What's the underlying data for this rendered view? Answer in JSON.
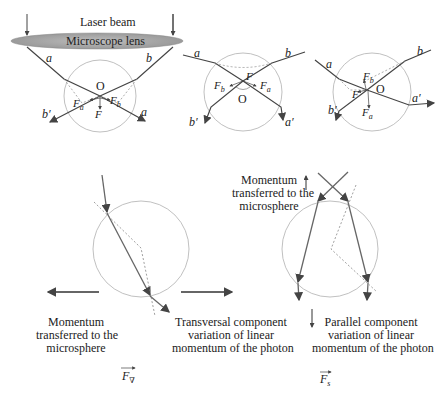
{
  "figure": {
    "top_left": {
      "laser_label": "Laser beam",
      "lens_label": "Microscope lens",
      "ray_a": "a",
      "ray_b": "b",
      "ray_a_out": "a",
      "ray_b_out": "b′",
      "center": "O",
      "force_a": "F",
      "force_a_sub": "a",
      "force_b": "F",
      "force_b_sub": "b",
      "force_total": "F"
    },
    "top_middle": {
      "ray_a": "a",
      "ray_b": "b",
      "ray_a_out": "a′",
      "ray_b_out": "b′",
      "center": "O",
      "force_a": "F",
      "force_a_sub": "a",
      "force_b": "F",
      "force_b_sub": "b",
      "force_total": "F"
    },
    "top_right": {
      "ray_a": "a",
      "ray_b": "b",
      "ray_a_out": "a′",
      "ray_b_out": "b′",
      "center": "O",
      "force_a": "F",
      "force_a_sub": "a",
      "force_b": "F",
      "force_b_sub": "b",
      "force_total": "F"
    },
    "bottom_left": {
      "momentum_label_1": "Momentum",
      "momentum_label_2": "transferred to the",
      "momentum_label_3": "microsphere",
      "transversal_label_1": "Transversal component",
      "transversal_label_2": "variation of linear",
      "transversal_label_3": "momentum of the photon",
      "force_symbol": "F",
      "force_sub": "∇"
    },
    "bottom_right": {
      "momentum_label_1": "Momentum",
      "momentum_label_2": "transferred to the",
      "momentum_label_3": "microsphere",
      "parallel_label_1": "Parallel component",
      "parallel_label_2": "variation of linear",
      "parallel_label_3": "momentum of the photon",
      "force_symbol": "F",
      "force_sub": "s"
    },
    "colors": {
      "ray": "#555555",
      "circle": "#b0b0b0",
      "dashed": "#777777",
      "lens_fill": "#a9a9a9",
      "text": "#222222"
    }
  }
}
